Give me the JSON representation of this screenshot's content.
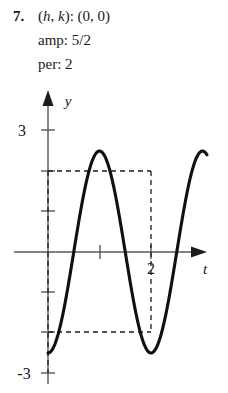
{
  "problem": {
    "number": "7.",
    "line1_prefix": "(",
    "line1_h": "h",
    "line1_mid": ", ",
    "line1_k": "k",
    "line1_suffix": "): (0, 0)",
    "line2": "amp: 5/2",
    "line3": "per: 2"
  },
  "chart_data": {
    "type": "line",
    "title": "",
    "xlabel": "t",
    "ylabel": "y",
    "function": "y = -2.5 cos(pi t)",
    "amplitude": 2.5,
    "period": 2,
    "midline": 0,
    "phase_shift": 0,
    "xlim": [
      -0.66,
      2.95
    ],
    "ylim": [
      -3.3,
      3.5
    ],
    "grid": false,
    "legend": false,
    "x_ticks": [
      1,
      2
    ],
    "x_tick_labels": [
      "",
      "2"
    ],
    "y_ticks": [
      3,
      2,
      1,
      -1,
      -2,
      -3
    ],
    "y_tick_labels": [
      "3",
      "",
      "",
      "",
      "",
      "-3"
    ],
    "x_axis_label_text": "t",
    "y_axis_label_text": "y",
    "annotations": [
      {
        "name": "upper-guide",
        "type": "dashed-horizontal",
        "y": 2.5,
        "x_from": 0,
        "x_to": 2
      },
      {
        "name": "lower-guide",
        "type": "dashed-horizontal",
        "y": -2.5,
        "x_from": 0,
        "x_to": 2
      },
      {
        "name": "left-guide",
        "type": "dashed-vertical",
        "x": 0,
        "y_from": -2.5,
        "y_to": 2.5
      },
      {
        "name": "right-guide",
        "type": "dashed-vertical",
        "x": 2,
        "y_from": -2.5,
        "y_to": 2.5
      }
    ],
    "points": [
      {
        "t": 0.0,
        "y": 2.5
      },
      {
        "t": 0.5,
        "y": 0.0
      },
      {
        "t": 1.0,
        "y": -2.5
      },
      {
        "t": 1.5,
        "y": 0.0
      },
      {
        "t": 2.0,
        "y": 2.5
      }
    ],
    "colors": {
      "curve": "#101010",
      "axis": "#58585a",
      "dashed": "#1c1c1c",
      "background": "#ffffff"
    }
  }
}
